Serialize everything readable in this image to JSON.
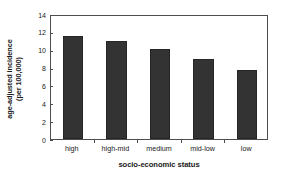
{
  "chart_data": {
    "type": "bar",
    "title": "",
    "xlabel": "socio-economic status",
    "ylabel_line1": "age-adjusted incidence",
    "ylabel_line2": "(per 100,000)",
    "categories": [
      "high",
      "high-mid",
      "medium",
      "mid-low",
      "low"
    ],
    "values": [
      11.5,
      11.0,
      10.1,
      9.0,
      7.75
    ],
    "ylim": [
      0,
      14
    ],
    "yticks": [
      0,
      2,
      4,
      6,
      8,
      10,
      12,
      14
    ],
    "ytick_labels": [
      "0",
      "2",
      "4",
      "6",
      "8",
      "10",
      "12",
      "14"
    ],
    "grid": false,
    "legend": "none",
    "bar_color": "#333333",
    "axis_color": "#4d4d4d",
    "background_color": "#ffffff",
    "series": [
      {
        "name": "age-adjusted incidence (per 100,000)",
        "values": [
          11.5,
          11.0,
          10.1,
          9.0,
          7.75
        ]
      }
    ]
  }
}
